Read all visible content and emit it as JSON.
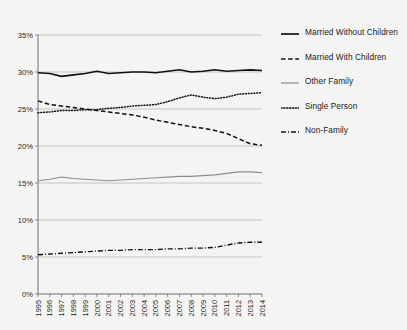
{
  "chart_data": {
    "type": "line",
    "title": "",
    "xlabel": "",
    "ylabel": "",
    "ylim": [
      0,
      35
    ],
    "ytick_labels": [
      "35%",
      "30%",
      "25%",
      "20%",
      "15%",
      "10%",
      "5%",
      "0%"
    ],
    "ytick_values": [
      35,
      30,
      25,
      20,
      15,
      10,
      5,
      0
    ],
    "grid": true,
    "legend_position": "right",
    "x": [
      1995,
      1996,
      1997,
      1998,
      1999,
      2000,
      2001,
      2002,
      2003,
      2004,
      2005,
      2006,
      2007,
      2008,
      2009,
      2010,
      2011,
      2012,
      2013,
      2014
    ],
    "categories": [
      "1995",
      "1996",
      "1997",
      "1998",
      "1999",
      "2000",
      "2001",
      "2002",
      "2003",
      "2004",
      "2005",
      "2006",
      "2007",
      "2008",
      "2009",
      "2010",
      "2011",
      "2012",
      "2013",
      "2014"
    ],
    "series": [
      {
        "name": "Married Without Children",
        "style": "solid-thick",
        "color": "#111111",
        "values": [
          29.9,
          29.8,
          29.4,
          29.6,
          29.8,
          30.1,
          29.8,
          29.9,
          30.0,
          30.0,
          29.9,
          30.1,
          30.3,
          30.0,
          30.1,
          30.3,
          30.1,
          30.2,
          30.3,
          30.2
        ]
      },
      {
        "name": "Married With Children",
        "style": "dashed",
        "color": "#111111",
        "values": [
          26.1,
          25.6,
          25.4,
          25.2,
          25.0,
          24.8,
          24.6,
          24.4,
          24.2,
          23.9,
          23.5,
          23.2,
          22.9,
          22.6,
          22.4,
          22.1,
          21.7,
          21.0,
          20.3,
          20.1
        ]
      },
      {
        "name": "Other Family",
        "style": "solid-thin",
        "color": "#8d8d8d",
        "values": [
          15.3,
          15.5,
          15.8,
          15.6,
          15.5,
          15.4,
          15.3,
          15.4,
          15.5,
          15.6,
          15.7,
          15.8,
          15.9,
          15.9,
          16.0,
          16.1,
          16.3,
          16.5,
          16.5,
          16.4
        ]
      },
      {
        "name": "Single Person",
        "style": "dotted",
        "color": "#111111",
        "values": [
          24.5,
          24.6,
          24.8,
          24.8,
          24.9,
          24.9,
          25.1,
          25.2,
          25.4,
          25.5,
          25.6,
          26.0,
          26.5,
          26.9,
          26.6,
          26.4,
          26.6,
          27.0,
          27.1,
          27.2
        ]
      },
      {
        "name": "Non-Family",
        "style": "dash-dot",
        "color": "#111111",
        "values": [
          5.3,
          5.4,
          5.5,
          5.6,
          5.7,
          5.8,
          5.9,
          5.9,
          6.0,
          6.0,
          6.0,
          6.1,
          6.1,
          6.2,
          6.2,
          6.3,
          6.6,
          6.9,
          7.0,
          7.0
        ]
      }
    ]
  },
  "legend": {
    "items": [
      {
        "label": "Married Without Children",
        "style": "solid-thick"
      },
      {
        "label": "Married With Children",
        "style": "dashed"
      },
      {
        "label": "Other Family",
        "style": "solid-thin"
      },
      {
        "label": "Single Person",
        "style": "dotted"
      },
      {
        "label": "Non-Family",
        "style": "dash-dot"
      }
    ]
  }
}
